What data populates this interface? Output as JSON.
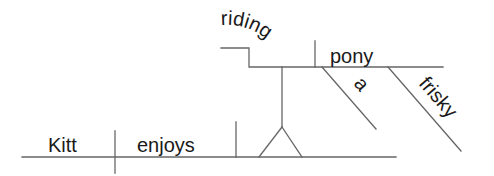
{
  "diagram": {
    "type": "sentence-diagram",
    "sentence": "Kitt enjoys riding a frisky pony",
    "line_color": "#666666",
    "text_color": "#1a1a1a",
    "words": {
      "subject": "Kitt",
      "verb": "enjoys",
      "gerund": "riding",
      "gerund_object": "pony",
      "article": "a",
      "adjective": "frisky"
    }
  }
}
